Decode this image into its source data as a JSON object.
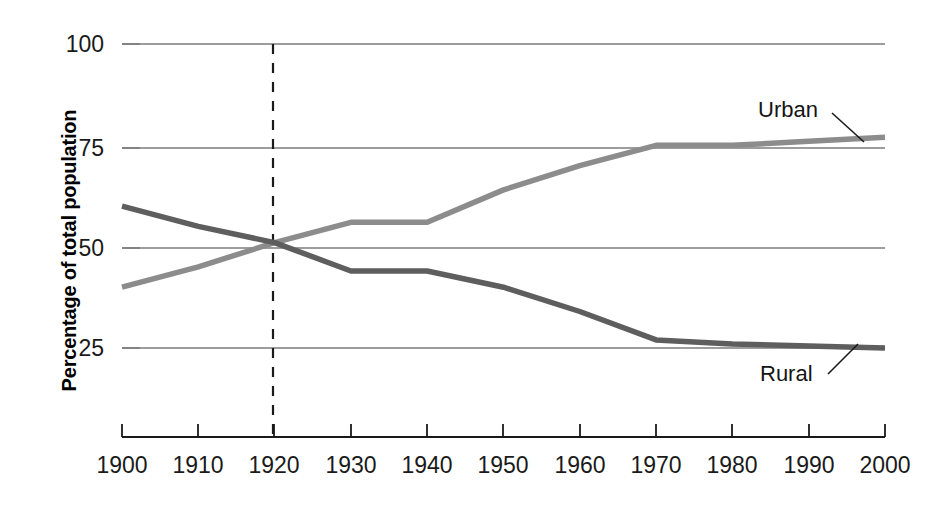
{
  "chart_data": {
    "type": "line",
    "title": "",
    "subtitle": "",
    "xlabel": "",
    "ylabel": "Percentage of total population",
    "x": [
      1900,
      1910,
      1920,
      1930,
      1940,
      1950,
      1960,
      1970,
      1980,
      1990,
      2000
    ],
    "xticklabels": [
      "1900",
      "1910",
      "1920",
      "1930",
      "1940",
      "1950",
      "1960",
      "1970",
      "1980",
      "1990",
      "2000"
    ],
    "yticklabels": [
      "25",
      "50",
      "75",
      "100"
    ],
    "yticks": [
      25,
      50,
      75,
      100
    ],
    "xlim": [
      1900,
      2000
    ],
    "ylim": [
      0,
      100
    ],
    "grid": "horizontal",
    "legend": "inline-annotations",
    "series": [
      {
        "name": "Urban",
        "color": "#8c8c8c",
        "values": [
          40,
          45,
          51,
          56,
          56,
          64,
          70,
          75,
          75,
          76,
          77
        ]
      },
      {
        "name": "Rural",
        "color": "#5e5e5e",
        "values": [
          60,
          55,
          51,
          44,
          44,
          40,
          34,
          27,
          26,
          25.5,
          25
        ]
      }
    ],
    "annotations": [
      {
        "text": "Urban",
        "series": "Urban",
        "at_x": 1990,
        "leader": true
      },
      {
        "text": "Rural",
        "series": "Rural",
        "at_x": 1990,
        "leader": true
      }
    ],
    "reference_line": {
      "name": "crossover-marker",
      "x": 1920,
      "style": "dashed",
      "color": "#1a1a1a"
    }
  },
  "colors": {
    "urban": "#8c8c8c",
    "rural": "#5e5e5e",
    "gridline": "#7d7d7d",
    "axis": "#1a1a1a",
    "text": "#141414",
    "background": "#ffffff"
  }
}
